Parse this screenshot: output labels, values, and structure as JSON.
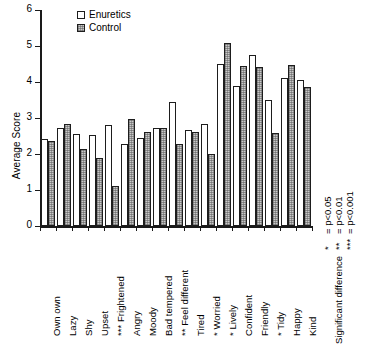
{
  "chart_data": {
    "type": "bar",
    "title": "",
    "xlabel": "",
    "ylabel": "Average Score",
    "ylim": [
      0,
      6
    ],
    "yticks": [
      0,
      1,
      2,
      3,
      4,
      5,
      6
    ],
    "grid": false,
    "legend_position": "top-left-inside",
    "categories": [
      "Own own",
      "Lazy",
      "Shy",
      "Upset",
      "*** Frightened",
      "Angry",
      "Moody",
      "Bad tempered",
      "** Feel different",
      "Tired",
      "* Worried",
      "* Lively",
      "Confident",
      "Friendly",
      "* Tidy",
      "Happy",
      "Kind"
    ],
    "series": [
      {
        "name": "Enuretics",
        "values": [
          2.42,
          2.73,
          2.56,
          2.54,
          2.8,
          2.27,
          2.45,
          2.72,
          3.45,
          2.68,
          2.82,
          4.49,
          3.9,
          4.75,
          3.5,
          4.11,
          4.05
        ]
      },
      {
        "name": "Control",
        "values": [
          2.35,
          2.82,
          2.15,
          1.9,
          1.1,
          2.96,
          2.6,
          2.72,
          2.28,
          2.62,
          1.99,
          5.09,
          4.45,
          4.42,
          2.57,
          4.48,
          3.85
        ]
      }
    ]
  },
  "legend": {
    "items": [
      {
        "label": "Enuretics",
        "swatch": "white-square",
        "color": "#ffffff"
      },
      {
        "label": "Control",
        "swatch": "hatched-gray-square",
        "color": "#c9c9c9"
      }
    ]
  },
  "significance_note": {
    "title": "Significant difference",
    "levels": [
      {
        "stars": "*",
        "equals": "=",
        "value": "p<0.05"
      },
      {
        "stars": "**",
        "equals": "=",
        "value": "p<0.01"
      },
      {
        "stars": "***",
        "equals": "=",
        "value": "p<0.001"
      }
    ]
  },
  "axis": {
    "y_label": "Average Score",
    "y_tick_labels": [
      "0",
      "1",
      "2",
      "3",
      "4",
      "5",
      "6"
    ]
  }
}
